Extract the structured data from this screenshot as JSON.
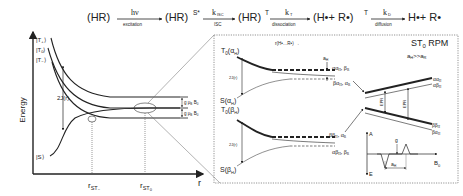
{
  "reaction_scheme": {
    "species": [
      "(HR)",
      "(HR)",
      "(HR)",
      "(H",
      "+ R",
      ")",
      "H",
      "+ R"
    ],
    "s0": "(HR)",
    "s1": "(HR)",
    "s1_sup": "S*",
    "s2": "(HR)",
    "s2_sup": "T",
    "s3": "(H•+ R•)",
    "s3_sup": "T",
    "s4": "H•+ R•",
    "arrows": [
      {
        "top": "hν",
        "bottom": "excitation"
      },
      {
        "top": "k",
        "top_sub": "ISC",
        "bottom": "ISC"
      },
      {
        "top": "k",
        "top_sub": "T",
        "bottom": "dissociation"
      },
      {
        "top": "k",
        "top_sub": "D",
        "bottom": "diffusion"
      }
    ]
  },
  "left_panel": {
    "y_axis_label": "Energy",
    "x_axis_label": "r",
    "levels": [
      "|T+⟩",
      "|T0⟩",
      "|T−⟩",
      "|S⟩"
    ],
    "level_labels": {
      "t_plus": "|T",
      "t_plus_sub": "+",
      "t_zero": "|T",
      "t_zero_sub": "0",
      "t_minus": "|T",
      "t_minus_sub": "−",
      "singlet": "|S⟩"
    },
    "exchange_label": "2J(r)",
    "zeeman_label": "g μ",
    "zeeman_sub": "B",
    "zeeman_field": "B",
    "zeeman_field_sub": "0",
    "x_ticks": [
      {
        "main": "r",
        "sub": "ST",
        "subsub": "−"
      },
      {
        "main": "r",
        "sub": "ST",
        "subsub": "0"
      }
    ]
  },
  "right_panel": {
    "title": "ST",
    "title_sub": "0",
    "title_rest": " RPM",
    "condition": "a",
    "condition_sub": "H",
    "condition_rest": ">>a",
    "condition_sub2": "R",
    "distance_label": "r(H•…R•) →",
    "upper": {
      "t0_label": "T",
      "t0_sub": "0",
      "t0_arg": "(α",
      "t0_arg_sub": "H",
      "s_label": "S(α",
      "s_sub": "H",
      "exchange": "2J(r)",
      "hyperfine": "a",
      "hyperfine_sub": "H",
      "state_a": "αα",
      "state_a_sub": "H",
      "state_a_rest": ", β",
      "state_a_sub2": "R",
      "state_b": "βα",
      "state_b_sub": "H",
      "state_b_rest": ", α",
      "state_b_sub2": "R"
    },
    "lower": {
      "t0_label": "T",
      "t0_sub": "0",
      "t0_arg": "(β",
      "t0_arg_sub": "H",
      "s_label": "S(β",
      "s_sub": "H",
      "exchange": "2J(r)",
      "state_a": "ββ",
      "state_a_sub": "H",
      "state_a_rest": ", α",
      "state_a_sub2": "R",
      "state_b": "αβ",
      "state_b_sub": "H",
      "state_b_rest": ", β",
      "state_b_sub2": "R"
    },
    "zeeman_levels": [
      {
        "label": "αα",
        "sub": "H"
      },
      {
        "label": "αβ",
        "sub": "H"
      },
      {
        "label": "ββ",
        "sub": "H"
      },
      {
        "label": "βα",
        "sub": "H"
      }
    ],
    "epr_label": "EPR",
    "spectrum": {
      "y_top": "A",
      "y_bottom": "E",
      "x_label": "B",
      "x_sub": "0",
      "g_label": "g",
      "split_label": "a",
      "split_sub": "H"
    }
  }
}
